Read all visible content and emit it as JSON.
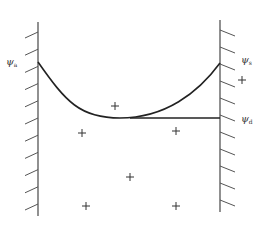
{
  "diagram": {
    "type": "potential-profile-between-walls",
    "colors": {
      "line": "#222222",
      "wall": "#555555",
      "hatch": "#555555",
      "marker": "#333333",
      "background": "#ffffff"
    },
    "labels": {
      "left": {
        "symbol": "ψ",
        "subscript": "a",
        "x": 6,
        "y": 57
      },
      "right_top": {
        "symbol": "ψ",
        "subscript": "s",
        "x": 241,
        "y": 55
      },
      "right_bottom": {
        "symbol": "ψ",
        "subscript": "d",
        "x": 241,
        "y": 114
      }
    },
    "walls": {
      "left": {
        "x": 38,
        "y1": 22,
        "y2": 216,
        "hatch_side": "left",
        "hatch_count": 11
      },
      "right": {
        "x": 220,
        "y1": 20,
        "y2": 212,
        "hatch_side": "right",
        "hatch_count": 11
      }
    },
    "curve": {
      "start": [
        38,
        62
      ],
      "min": [
        120,
        118
      ],
      "end": [
        220,
        63
      ]
    },
    "flat_line": {
      "from": [
        130,
        118
      ],
      "to": [
        220,
        118
      ]
    },
    "markers": {
      "symbol": "+",
      "positions": [
        [
          115,
          106
        ],
        [
          82,
          133
        ],
        [
          176,
          131
        ],
        [
          130,
          177
        ],
        [
          86,
          206
        ],
        [
          176,
          206
        ],
        [
          242,
          80
        ]
      ]
    }
  }
}
